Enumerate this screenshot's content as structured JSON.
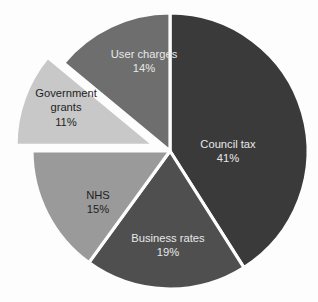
{
  "chart_data": {
    "type": "pie",
    "title": "",
    "subtitle": "",
    "xlabel": "",
    "ylabel": "",
    "legend_position": "none",
    "grid": false,
    "units": "percent",
    "start_angle_deg": 0,
    "direction": "clockwise",
    "categories": [
      "Council tax",
      "Business rates",
      "NHS",
      "Government grants",
      "User charges"
    ],
    "values": [
      41,
      19,
      15,
      11,
      14
    ],
    "labels_text": [
      "Council tax",
      "Business rates",
      "NHS",
      "Government grants",
      "User charges"
    ],
    "value_labels": [
      "41%",
      "19%",
      "15%",
      "11%",
      "14%"
    ],
    "colors": [
      "#3a3a3a",
      "#4f4f4f",
      "#9a9a9a",
      "#c8c8c8",
      "#6e6e6e"
    ],
    "exploded": [
      false,
      false,
      false,
      true,
      false
    ],
    "background_color": "#fdfdfd",
    "separator_color": "#fdfdfd",
    "slices": [
      {
        "name": "Council tax",
        "percent": 41,
        "value_label": "41%",
        "color": "#3a3a3a",
        "exploded": false,
        "start_angle": 0,
        "end_angle": 147.6,
        "label_line1": "Council tax",
        "label_line2": "41%",
        "label_x": 228,
        "label_y": 152,
        "label_on_dark": true
      },
      {
        "name": "Business rates",
        "percent": 19,
        "value_label": "19%",
        "color": "#4f4f4f",
        "exploded": false,
        "start_angle": 147.6,
        "end_angle": 216.0,
        "label_line1": "Business rates",
        "label_line2": "19%",
        "label_x": 168,
        "label_y": 246,
        "label_on_dark": true
      },
      {
        "name": "NHS",
        "percent": 15,
        "value_label": "15%",
        "color": "#9a9a9a",
        "exploded": false,
        "start_angle": 216.0,
        "end_angle": 270.0,
        "label_line1": "NHS",
        "label_line2": "15%",
        "label_x": 98,
        "label_y": 203,
        "label_on_dark": false
      },
      {
        "name": "Government grants",
        "percent": 11,
        "value_label": "11%",
        "color": "#c8c8c8",
        "exploded": true,
        "start_angle": 270.0,
        "end_angle": 309.6,
        "label_line1": "Government",
        "label_line2": "grants",
        "label_line3": "11%",
        "label_x": 66,
        "label_y": 108,
        "label_on_dark": false
      },
      {
        "name": "User charges",
        "percent": 14,
        "value_label": "14%",
        "color": "#6e6e6e",
        "exploded": false,
        "start_angle": 309.6,
        "end_angle": 360.0,
        "label_line1": "User charges",
        "label_line2": "14%",
        "label_x": 144,
        "label_y": 62,
        "label_on_dark": true
      }
    ],
    "geometry": {
      "center_x": 170,
      "center_y": 151,
      "radius": 138,
      "explode_offset": 17
    }
  }
}
